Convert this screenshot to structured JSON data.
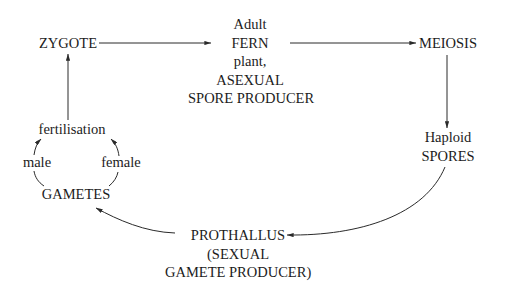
{
  "diagram": {
    "nodes": {
      "zygote": {
        "lines": [
          "ZYGOTE"
        ]
      },
      "adult_fern": {
        "lines": [
          "Adult",
          "FERN",
          "plant,",
          "ASEXUAL",
          "SPORE PRODUCER"
        ]
      },
      "meiosis": {
        "lines": [
          "MEIOSIS"
        ]
      },
      "spores": {
        "lines": [
          "Haploid",
          "SPORES"
        ]
      },
      "prothallus": {
        "lines": [
          "PROTHALLUS",
          "(SEXUAL",
          "GAMETE PRODUCER)"
        ]
      },
      "gametes": {
        "lines": [
          "GAMETES"
        ]
      },
      "fertilisation": {
        "lines": [
          "fertilisation"
        ]
      },
      "male": {
        "lines": [
          "male"
        ]
      },
      "female": {
        "lines": [
          "female"
        ]
      }
    },
    "edges": [
      {
        "from": "ZYGOTE",
        "to": "Adult FERN plant"
      },
      {
        "from": "Adult FERN plant",
        "to": "MEIOSIS"
      },
      {
        "from": "MEIOSIS",
        "to": "Haploid SPORES"
      },
      {
        "from": "Haploid SPORES",
        "to": "PROTHALLUS"
      },
      {
        "from": "PROTHALLUS",
        "to": "GAMETES"
      },
      {
        "from": "GAMETES (male)",
        "to": "fertilisation"
      },
      {
        "from": "GAMETES (female)",
        "to": "fertilisation"
      },
      {
        "from": "fertilisation",
        "to": "ZYGOTE"
      }
    ],
    "colors": {
      "line": "#2a2a2a",
      "text": "#1c1c1c",
      "background": "#ffffff"
    }
  }
}
